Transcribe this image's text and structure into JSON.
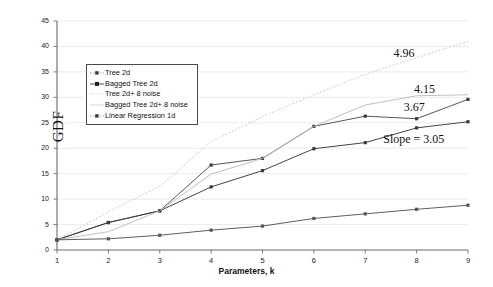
{
  "chart_data": {
    "type": "line",
    "title": "",
    "xlabel": "Parameters, k",
    "ylabel": "GDF",
    "x": [
      1,
      2,
      3,
      4,
      5,
      6,
      7,
      8,
      9
    ],
    "xlim": [
      1,
      9
    ],
    "ylim": [
      0,
      45
    ],
    "xticks": [
      "1",
      "2",
      "3",
      "4",
      "5",
      "6",
      "7",
      "8",
      "9"
    ],
    "yticks": [
      "0",
      "5",
      "10",
      "15",
      "20",
      "25",
      "30",
      "35",
      "40",
      "45"
    ],
    "grid": "horizontal",
    "legend_position": "upper-left-inside",
    "series": [
      {
        "name": "Tree 2d",
        "color": "#4d4d4d",
        "style": "solid",
        "marker": "square",
        "values": [
          2.0,
          5.4,
          7.7,
          16.7,
          18.0,
          24.3,
          26.3,
          25.8,
          29.6
        ]
      },
      {
        "name": "Bagged Tree 2d",
        "color": "#3a3a3a",
        "style": "solid",
        "marker": "square",
        "values": [
          2.0,
          5.4,
          7.7,
          12.4,
          15.6,
          19.9,
          21.1,
          24.0,
          25.2
        ]
      },
      {
        "name": "Tree 2d+ 8 noise",
        "color": "#c9c9c9",
        "style": "dotted",
        "marker": "none",
        "values": [
          2.0,
          7.5,
          12.5,
          21.3,
          26.2,
          30.5,
          34.5,
          37.8,
          41.0
        ]
      },
      {
        "name": "Bagged Tree 2d+ 8 noise",
        "color": "#bdbdbd",
        "style": "solid",
        "marker": "none",
        "values": [
          2.0,
          3.6,
          7.7,
          14.9,
          18.0,
          24.3,
          28.5,
          30.3,
          30.5
        ]
      },
      {
        "name": "Linear Regression 1d",
        "color": "#555555",
        "style": "solid",
        "marker": "square",
        "values": [
          2.0,
          2.2,
          2.9,
          3.9,
          4.7,
          6.2,
          7.1,
          8.0,
          8.8
        ]
      }
    ],
    "annotations": [
      {
        "text": "4.96",
        "x": 7.55,
        "y": 38.5,
        "series": "Tree 2d+ 8 noise"
      },
      {
        "text": "4.15",
        "x": 7.95,
        "y": 31.5,
        "series": "Bagged Tree 2d+ 8 noise"
      },
      {
        "text": "3.67",
        "x": 7.75,
        "y": 28.0,
        "series": "Tree 2d"
      },
      {
        "text": "Slope = 3.05",
        "x": 7.35,
        "y": 21.6,
        "series": "Bagged Tree 2d"
      }
    ]
  },
  "legend": {
    "entries": [
      {
        "label": "Tree 2d"
      },
      {
        "label": "Bagged Tree 2d"
      },
      {
        "label": "Tree 2d+ 8 noise"
      },
      {
        "label": "Bagged Tree 2d+ 8 noise"
      },
      {
        "label": "Linear Regression 1d"
      }
    ]
  },
  "axes": {
    "y_title": "GDF",
    "x_title": "Parameters, k"
  },
  "colors": {
    "axis": "#6b6b6b",
    "grid": "#e3e3ea",
    "text": "#111111",
    "background": "#ffffff"
  }
}
